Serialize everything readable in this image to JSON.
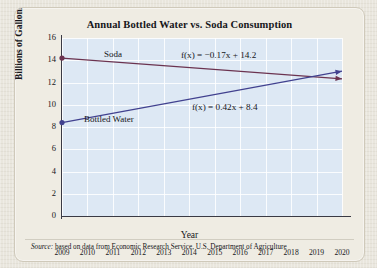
{
  "card": {
    "title": "Annual Bottled Water vs. Soda Consumption",
    "source_prefix": "Source:",
    "source_text": " based on data from Economic Research Service, U.S. Department of Agriculture"
  },
  "colors": {
    "page_background": "#e9e6dd",
    "card_background": "#efece3",
    "plot_background": "#dde8f4",
    "grid": "#ffffff",
    "axis": "#3a3a44",
    "soda_line": "#6b3350",
    "water_line": "#41418f",
    "text": "#16161a"
  },
  "annotations": {
    "soda_label": "Soda",
    "water_label": "Bottled Water",
    "soda_equation": "f(x) = −0.17x + 14.2",
    "water_equation": "f(x) = 0.42x + 8.4"
  },
  "chart_data": {
    "type": "line",
    "title": "Annual Bottled Water vs. Soda Consumption",
    "xlabel": "Year",
    "ylabel": "Billions of Gallons",
    "grid": true,
    "legend": "inline-labels",
    "xlim": [
      2009,
      2020
    ],
    "ylim": [
      0,
      16
    ],
    "ytick_step": 2,
    "yticks": [
      0,
      2,
      4,
      6,
      8,
      10,
      12,
      14,
      16
    ],
    "xticks": [
      2009,
      2010,
      2011,
      2012,
      2013,
      2014,
      2015,
      2016,
      2017,
      2018,
      2019,
      2020
    ],
    "x": [
      2009,
      2020
    ],
    "series": [
      {
        "name": "Soda",
        "color": "#6b3350",
        "equation": "f(x) = −0.17x + 14.2",
        "slope": -0.17,
        "intercept": 14.2,
        "marker_at_start": true,
        "arrow_at_end": true,
        "values": [
          14.2,
          12.33
        ]
      },
      {
        "name": "Bottled Water",
        "color": "#41418f",
        "equation": "f(x) = 0.42x + 8.4",
        "slope": 0.42,
        "intercept": 8.4,
        "marker_at_start": true,
        "arrow_at_end": true,
        "values": [
          8.4,
          13.02
        ]
      }
    ]
  }
}
